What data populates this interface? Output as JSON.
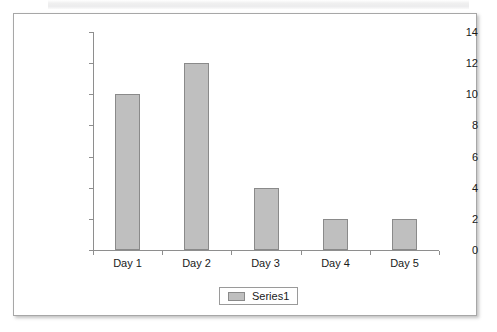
{
  "chart_data": {
    "type": "bar",
    "title": "",
    "subtitle": "",
    "xlabel": "",
    "ylabel": "",
    "categories": [
      "Day 1",
      "Day 2",
      "Day 3",
      "Day 4",
      "Day 5"
    ],
    "series": [
      {
        "name": "Series1",
        "values": [
          10,
          12,
          4,
          2,
          2
        ],
        "color": "#bfbfbf",
        "border_color": "#8a8a8a"
      }
    ],
    "ylim": [
      0,
      14
    ],
    "y_ticks": [
      0,
      2,
      4,
      6,
      8,
      10,
      12,
      14
    ],
    "y_tick_labels": [
      "0",
      "2",
      "4",
      "6",
      "8",
      "10",
      "12",
      "14"
    ],
    "grid": false,
    "legend": {
      "position": "bottom",
      "entries": [
        "Series1"
      ]
    },
    "axis_color": "#8e8e8e",
    "plot_background": "#ffffff",
    "panel_border_color": "#a7a7a7"
  }
}
